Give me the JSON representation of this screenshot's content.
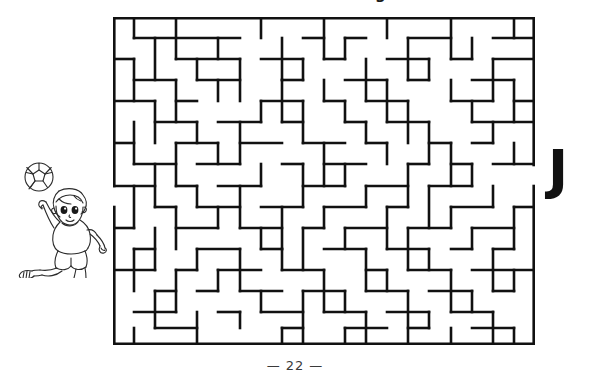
{
  "page": {
    "title": "Mazes and Coloring",
    "number": "22",
    "footer_dash_left": "—",
    "footer_dash_right": "—",
    "background_color": "#ffffff",
    "ink_color": "#111111"
  },
  "maze": {
    "name": "soccer-maze",
    "cols": 20,
    "rows": 15,
    "cell_size": 21.1,
    "wall_color": "#111111",
    "wall_thickness": 2.6,
    "entrance": {
      "side": "left",
      "row": 9
    },
    "exit": {
      "side": "right",
      "row": 7
    },
    "border_segments": [
      "top:0-20",
      "bottom:0-20",
      "left:0-8",
      "left:9-15",
      "right:0-6",
      "right:8-15"
    ],
    "h_walls": [
      [
        1,
        1,
        5
      ],
      [
        6,
        1,
        8
      ],
      [
        9,
        1,
        10
      ],
      [
        11,
        1,
        13
      ],
      [
        14,
        1,
        16
      ],
      [
        17,
        1,
        19
      ],
      [
        0,
        2,
        1
      ],
      [
        2,
        2,
        4
      ],
      [
        5,
        2,
        7
      ],
      [
        8,
        2,
        9
      ],
      [
        10,
        2,
        12
      ],
      [
        13,
        2,
        14
      ],
      [
        15,
        2,
        16
      ],
      [
        18,
        2,
        20
      ],
      [
        1,
        3,
        2
      ],
      [
        3,
        3,
        4
      ],
      [
        6,
        3,
        8
      ],
      [
        9,
        3,
        11
      ],
      [
        12,
        3,
        13
      ],
      [
        14,
        3,
        15
      ],
      [
        16,
        3,
        18
      ],
      [
        0,
        4,
        3
      ],
      [
        4,
        4,
        5
      ],
      [
        7,
        4,
        9
      ],
      [
        10,
        4,
        11
      ],
      [
        12,
        4,
        14
      ],
      [
        16,
        4,
        17
      ],
      [
        18,
        4,
        19
      ],
      [
        2,
        5,
        4
      ],
      [
        5,
        5,
        7
      ],
      [
        8,
        5,
        10
      ],
      [
        11,
        5,
        12
      ],
      [
        13,
        5,
        15
      ],
      [
        17,
        5,
        19
      ],
      [
        0,
        6,
        1
      ],
      [
        3,
        6,
        5
      ],
      [
        6,
        6,
        8
      ],
      [
        9,
        6,
        11
      ],
      [
        12,
        6,
        13
      ],
      [
        15,
        6,
        16
      ],
      [
        17,
        6,
        18
      ],
      [
        1,
        7,
        3
      ],
      [
        4,
        7,
        6
      ],
      [
        8,
        7,
        9
      ],
      [
        10,
        7,
        12
      ],
      [
        14,
        7,
        15
      ],
      [
        16,
        7,
        17
      ],
      [
        18,
        7,
        20
      ],
      [
        0,
        8,
        2
      ],
      [
        3,
        8,
        4
      ],
      [
        5,
        8,
        7
      ],
      [
        9,
        8,
        11
      ],
      [
        12,
        8,
        14
      ],
      [
        15,
        8,
        17
      ],
      [
        2,
        9,
        3
      ],
      [
        4,
        9,
        6
      ],
      [
        7,
        9,
        9
      ],
      [
        10,
        9,
        12
      ],
      [
        13,
        9,
        14
      ],
      [
        16,
        9,
        18
      ],
      [
        19,
        9,
        20
      ],
      [
        0,
        10,
        1
      ],
      [
        3,
        10,
        5
      ],
      [
        6,
        10,
        8
      ],
      [
        9,
        10,
        10
      ],
      [
        11,
        10,
        13
      ],
      [
        14,
        10,
        16
      ],
      [
        17,
        10,
        19
      ],
      [
        1,
        11,
        2
      ],
      [
        4,
        11,
        6
      ],
      [
        7,
        11,
        8
      ],
      [
        10,
        11,
        12
      ],
      [
        13,
        11,
        15
      ],
      [
        16,
        11,
        17
      ],
      [
        18,
        11,
        19
      ],
      [
        0,
        12,
        2
      ],
      [
        3,
        12,
        4
      ],
      [
        5,
        12,
        7
      ],
      [
        8,
        12,
        10
      ],
      [
        12,
        12,
        13
      ],
      [
        14,
        12,
        16
      ],
      [
        17,
        12,
        20
      ],
      [
        2,
        13,
        3
      ],
      [
        4,
        13,
        5
      ],
      [
        6,
        13,
        8
      ],
      [
        9,
        13,
        11
      ],
      [
        12,
        13,
        14
      ],
      [
        15,
        13,
        17
      ],
      [
        18,
        13,
        19
      ],
      [
        1,
        14,
        3
      ],
      [
        5,
        14,
        6
      ],
      [
        7,
        14,
        9
      ],
      [
        10,
        14,
        12
      ],
      [
        13,
        14,
        15
      ],
      [
        16,
        14,
        18
      ]
    ],
    "v_walls": [
      [
        1,
        0,
        1
      ],
      [
        3,
        0,
        2
      ],
      [
        7,
        0,
        1
      ],
      [
        10,
        0,
        2
      ],
      [
        13,
        0,
        1
      ],
      [
        16,
        0,
        2
      ],
      [
        19,
        0,
        1
      ],
      [
        2,
        1,
        3
      ],
      [
        5,
        1,
        2
      ],
      [
        8,
        1,
        3
      ],
      [
        11,
        1,
        2
      ],
      [
        14,
        1,
        3
      ],
      [
        17,
        1,
        2
      ],
      [
        1,
        2,
        4
      ],
      [
        4,
        2,
        3
      ],
      [
        6,
        2,
        4
      ],
      [
        9,
        2,
        3
      ],
      [
        12,
        2,
        4
      ],
      [
        15,
        2,
        3
      ],
      [
        18,
        2,
        4
      ],
      [
        3,
        3,
        5
      ],
      [
        5,
        3,
        4
      ],
      [
        8,
        3,
        5
      ],
      [
        10,
        3,
        4
      ],
      [
        13,
        3,
        5
      ],
      [
        16,
        3,
        4
      ],
      [
        19,
        3,
        5
      ],
      [
        2,
        4,
        6
      ],
      [
        7,
        4,
        5
      ],
      [
        9,
        4,
        6
      ],
      [
        11,
        4,
        5
      ],
      [
        14,
        4,
        6
      ],
      [
        17,
        4,
        5
      ],
      [
        1,
        5,
        7
      ],
      [
        4,
        5,
        6
      ],
      [
        6,
        5,
        7
      ],
      [
        8,
        5,
        6
      ],
      [
        12,
        5,
        7
      ],
      [
        15,
        5,
        6
      ],
      [
        18,
        5,
        7
      ],
      [
        3,
        6,
        8
      ],
      [
        5,
        6,
        7
      ],
      [
        10,
        6,
        8
      ],
      [
        13,
        6,
        7
      ],
      [
        16,
        6,
        8
      ],
      [
        19,
        6,
        7
      ],
      [
        2,
        7,
        9
      ],
      [
        7,
        7,
        8
      ],
      [
        9,
        7,
        9
      ],
      [
        11,
        7,
        8
      ],
      [
        14,
        7,
        9
      ],
      [
        17,
        7,
        8
      ],
      [
        1,
        8,
        10
      ],
      [
        4,
        8,
        9
      ],
      [
        6,
        8,
        10
      ],
      [
        12,
        8,
        9
      ],
      [
        15,
        8,
        10
      ],
      [
        18,
        8,
        9
      ],
      [
        3,
        9,
        11
      ],
      [
        5,
        9,
        10
      ],
      [
        8,
        9,
        11
      ],
      [
        10,
        9,
        10
      ],
      [
        13,
        9,
        11
      ],
      [
        16,
        9,
        10
      ],
      [
        19,
        9,
        11
      ],
      [
        2,
        10,
        12
      ],
      [
        7,
        10,
        11
      ],
      [
        9,
        10,
        12
      ],
      [
        11,
        10,
        11
      ],
      [
        14,
        10,
        12
      ],
      [
        17,
        10,
        11
      ],
      [
        1,
        11,
        13
      ],
      [
        4,
        11,
        12
      ],
      [
        6,
        11,
        13
      ],
      [
        8,
        11,
        12
      ],
      [
        12,
        11,
        13
      ],
      [
        15,
        11,
        12
      ],
      [
        18,
        11,
        13
      ],
      [
        3,
        12,
        14
      ],
      [
        5,
        12,
        13
      ],
      [
        10,
        12,
        14
      ],
      [
        13,
        12,
        13
      ],
      [
        16,
        12,
        14
      ],
      [
        19,
        12,
        13
      ],
      [
        2,
        13,
        15
      ],
      [
        7,
        13,
        14
      ],
      [
        9,
        13,
        15
      ],
      [
        11,
        13,
        14
      ],
      [
        14,
        13,
        15
      ],
      [
        17,
        13,
        14
      ]
    ]
  },
  "mascot": {
    "name": "child-playing-ball",
    "description": "line-art boy catching a soccer ball",
    "line_color": "#2a2a2a"
  },
  "exit_marker": {
    "label": "J",
    "name": "exit-letter-j"
  }
}
